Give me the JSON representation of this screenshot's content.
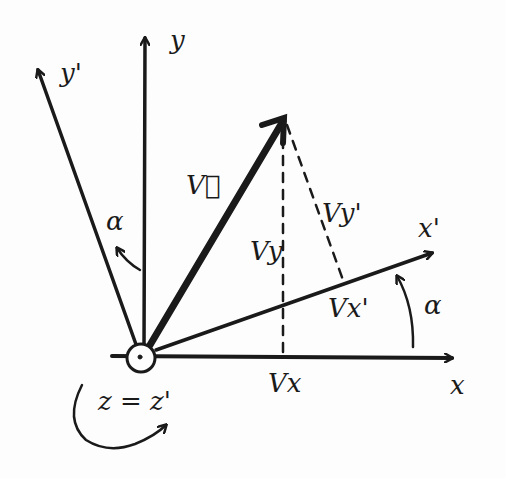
{
  "diagram": {
    "colors": {
      "ink": "#1a1a1a",
      "paper": "#fdfdfd"
    },
    "axes": {
      "x": {
        "label": "x"
      },
      "y": {
        "label": "y"
      },
      "x_prime": {
        "label": "x'"
      },
      "y_prime": {
        "label": "y'"
      },
      "z": {
        "label": "z = z'"
      }
    },
    "vector": {
      "label": "V⃗"
    },
    "components": {
      "vx": "Vx",
      "vy": "Vy",
      "vx_prime": "Vx'",
      "vy_prime": "Vy'"
    },
    "angles": {
      "alpha_top": "α",
      "alpha_right": "α"
    }
  }
}
